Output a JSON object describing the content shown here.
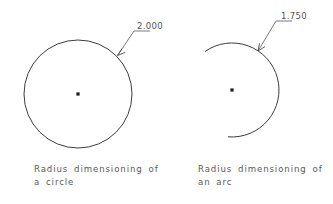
{
  "page": {
    "background_color": "#ffffff",
    "line_color": "#3c3c3c",
    "leader_color": "#6b6b6b",
    "text_color": "#5a5a5a",
    "width": 333,
    "height": 204
  },
  "figures": [
    {
      "id": "circle",
      "kind": "circle",
      "dimension_value": "2.000",
      "dimension_type": "radius",
      "center": {
        "x": 78,
        "y": 94
      },
      "radius": 54,
      "caption_line1": "Radius  dimensioning  of",
      "caption_line2": "a  circle",
      "leader": {
        "arrow_point": {
          "x": 117.5,
          "y": 55.5
        },
        "elbow": {
          "x": 134,
          "y": 31
        },
        "landing_end": {
          "x": 150,
          "y": 31
        }
      }
    },
    {
      "id": "arc",
      "kind": "arc",
      "dimension_value": "1.750",
      "dimension_type": "radius",
      "center": {
        "x": 232,
        "y": 90
      },
      "radius": 47,
      "start_angle_deg": 125,
      "end_angle_deg": 265,
      "caption_line1": "Radius  dimensioning  of",
      "caption_line2": "an  arc",
      "leader": {
        "arrow_point": {
          "x": 258,
          "y": 51
        },
        "elbow": {
          "x": 276,
          "y": 21
        },
        "landing_end": {
          "x": 292,
          "y": 21
        }
      }
    }
  ]
}
